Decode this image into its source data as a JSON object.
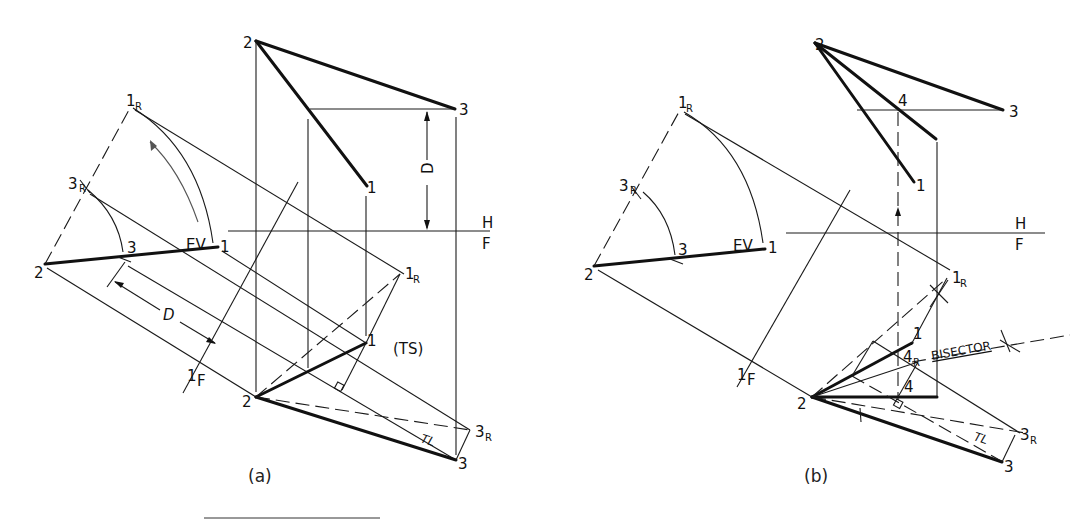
{
  "figure": {
    "panels": [
      {
        "id": "a",
        "caption": "(a)",
        "labels": {
          "top_2": "2",
          "top_3": "3",
          "top_1": "1",
          "dim_D_top": "D",
          "fold_H": "H",
          "fold_F": "F",
          "aux_1R": "1",
          "aux_1R_sub": "R",
          "aux_3R": "3",
          "aux_3R_sub": "R",
          "aux_2": "2",
          "aux_3": "3",
          "aux_1": "1",
          "aux_EV": "EV",
          "dim_D_aux": "D",
          "fold_1": "1",
          "fold_1F": "F",
          "front_1R": "1",
          "front_1R_sub": "R",
          "front_1": "1",
          "front_TS": "(TS)",
          "front_2": "2",
          "front_TL": "TL",
          "front_3R": "3",
          "front_3R_sub": "R",
          "front_3": "3"
        }
      },
      {
        "id": "b",
        "caption": "(b)",
        "labels": {
          "top_2": "2",
          "top_4": "4",
          "top_3": "3",
          "top_1": "1",
          "fold_H": "H",
          "fold_F": "F",
          "aux_1R": "1",
          "aux_1R_sub": "R",
          "aux_3R": "3",
          "aux_3R_sub": "R",
          "aux_2": "2",
          "aux_3": "3",
          "aux_1": "1",
          "aux_EV": "EV",
          "fold_1": "1",
          "fold_1F": "F",
          "front_1R": "1",
          "front_1R_sub": "R",
          "front_1": "1",
          "front_4R": "4",
          "front_4R_sub": "R",
          "bisector": "BISECTOR",
          "front_4": "4",
          "front_2": "2",
          "front_TL": "TL",
          "front_3R": "3",
          "front_3R_sub": "R",
          "front_3": "3"
        }
      }
    ]
  }
}
